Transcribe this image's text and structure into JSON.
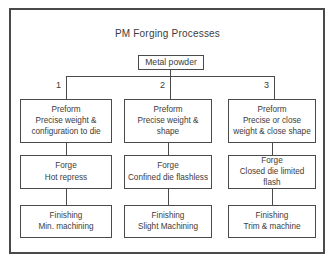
{
  "diagram": {
    "title": "PM Forging Processes",
    "root": {
      "label": "Metal powder"
    },
    "branches": [
      {
        "number": "1",
        "steps": [
          {
            "header": "Preform",
            "body": "Precise weight & configuration to die"
          },
          {
            "header": "Forge",
            "body": "Hot repress"
          },
          {
            "header": "Finishing",
            "body": "Min. machining"
          }
        ]
      },
      {
        "number": "2",
        "steps": [
          {
            "header": "Preform",
            "body": "Precise weight & shape"
          },
          {
            "header": "Forge",
            "body": "Confined die flashless"
          },
          {
            "header": "Finishing",
            "body": "Slight Machining"
          }
        ]
      },
      {
        "number": "3",
        "steps": [
          {
            "header": "Preform",
            "body": "Precise or close weight & close shape"
          },
          {
            "header": "Forge",
            "body": "Closed die limited flash"
          },
          {
            "header": "Finishing",
            "body": "Trim & machine"
          }
        ]
      }
    ],
    "colors": {
      "line": "#4a4a4a",
      "text": "#3c3c3c",
      "background": "#ffffff"
    }
  }
}
